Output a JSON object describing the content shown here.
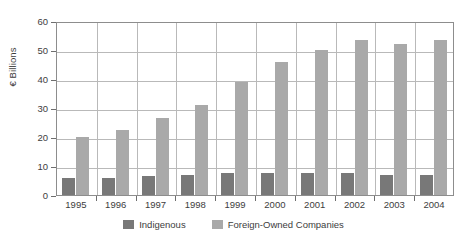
{
  "chart_data": {
    "type": "bar",
    "title": "",
    "subtitle": "",
    "xlabel": "",
    "ylabel": "€ Billions",
    "categories": [
      "1995",
      "1996",
      "1997",
      "1998",
      "1999",
      "2000",
      "2001",
      "2002",
      "2003",
      "2004"
    ],
    "series": [
      {
        "name": "Indigenous",
        "color": "#787878",
        "values": [
          6.0,
          6.0,
          6.5,
          7.0,
          7.5,
          7.5,
          7.5,
          7.5,
          7.0,
          7.0
        ]
      },
      {
        "name": "Foreign-Owned Companies",
        "color": "#a9a9a9",
        "values": [
          20.0,
          22.5,
          26.5,
          31.0,
          39.0,
          46.0,
          50.0,
          53.5,
          52.0,
          53.5
        ]
      }
    ],
    "ylim": [
      0,
      60
    ],
    "yticks": [
      0,
      10,
      20,
      30,
      40,
      50,
      60
    ],
    "ytick_labels": [
      "0",
      "10",
      "20",
      "30",
      "40",
      "50",
      "60"
    ],
    "grid": "both",
    "legend_position": "bottom"
  },
  "axis": {
    "y_title": "€ Billions"
  },
  "legend": {
    "items": [
      {
        "label": "Indigenous",
        "color": "#787878"
      },
      {
        "label": "Foreign-Owned Companies",
        "color": "#a9a9a9"
      }
    ]
  },
  "colors": {
    "indigenous": "#787878",
    "foreign_owned": "#a9a9a9",
    "grid": "#b9b9b9",
    "axis": "#8d8d8d",
    "text": "#3d3d3d",
    "background": "#ffffff"
  }
}
